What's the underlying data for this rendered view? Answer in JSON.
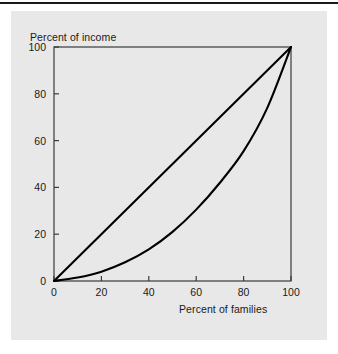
{
  "figure": {
    "background_color": "#e8e8e8",
    "page_color": "#ffffff",
    "rule_color": "#1a1a1a",
    "line_color": "#000000"
  },
  "chart_data": {
    "type": "line",
    "title": "",
    "subtitle": "",
    "xlabel": "Percent of families",
    "ylabel": "Percent of income",
    "xlim": [
      0,
      100
    ],
    "ylim": [
      0,
      100
    ],
    "xticks": [
      0,
      20,
      40,
      60,
      80,
      100
    ],
    "yticks": [
      0,
      20,
      40,
      60,
      80,
      100
    ],
    "xtick_labels": [
      "0",
      "20",
      "40",
      "60",
      "80",
      "100"
    ],
    "ytick_labels": [
      "0",
      "20",
      "40",
      "60",
      "80",
      "100"
    ],
    "grid": false,
    "legend": false,
    "legend_position": "none",
    "annotations": [],
    "series": [
      {
        "name": "Line of perfect equality",
        "x": [
          0,
          100
        ],
        "values": [
          0,
          100
        ]
      },
      {
        "name": "Lorenz curve",
        "x": [
          0,
          10,
          20,
          30,
          40,
          50,
          60,
          70,
          80,
          90,
          100
        ],
        "values": [
          0,
          1.5,
          4,
          8,
          13.5,
          21,
          30.5,
          42,
          55.5,
          74,
          100
        ]
      }
    ]
  }
}
